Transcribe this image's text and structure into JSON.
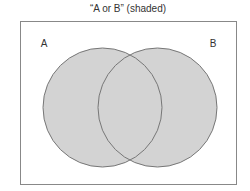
{
  "diagram": {
    "title": "“A or B” (shaded)",
    "type": "venn",
    "universe": {
      "x": 20,
      "y": 21,
      "width": 217,
      "height": 164,
      "stroke": "#888888"
    },
    "sets": [
      {
        "label": "A",
        "cx": 102.5,
        "cy": 107.5,
        "r": 59.5,
        "label_x": 44,
        "label_y": 47
      },
      {
        "label": "B",
        "cx": 157.5,
        "cy": 107.5,
        "r": 59.5,
        "label_x": 213,
        "label_y": 47
      }
    ],
    "shaded_region": "A ∪ B",
    "colors": {
      "fill": "#d3d3d3",
      "outline": "#777777",
      "text": "#333333"
    }
  }
}
